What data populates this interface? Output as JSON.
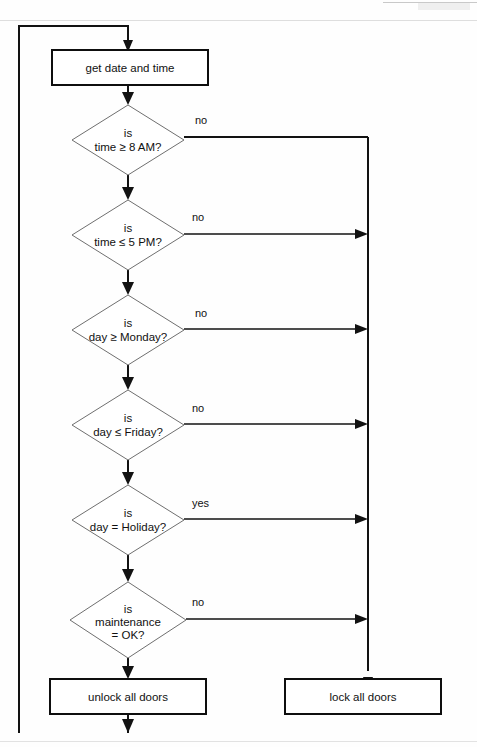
{
  "diagram": {
    "type": "flowchart",
    "canvas": {
      "width": 477,
      "height": 747
    },
    "colors": {
      "background": "#fefefe",
      "process_stroke": "#0e0e0e",
      "decision_stroke": "#6f6f6f",
      "connector": "#121212",
      "text": "#111111",
      "scan_rule": "#dedede"
    },
    "start_label": "",
    "nodes": [
      {
        "id": "get-date-time",
        "shape": "process",
        "label": "get date and time",
        "lines": [
          "get date and time"
        ],
        "x": 52,
        "y": 50,
        "w": 156,
        "h": 35
      },
      {
        "id": "time-ge-8am",
        "shape": "decision",
        "label": "is time ≥ 8 AM?",
        "lines": [
          "is",
          "time ≥ 8 "
        ],
        "tail": "AM?",
        "cx": 128,
        "cy": 140,
        "rx": 56,
        "ry": 35,
        "branch_label": "no",
        "branch_side": "right"
      },
      {
        "id": "time-le-5pm",
        "shape": "decision",
        "label": "is time ≤ 5 PM?",
        "lines": [
          "is",
          "time ≤ 5 "
        ],
        "tail": "PM?",
        "cx": 128,
        "cy": 235,
        "rx": 56,
        "ry": 35,
        "branch_label": "no",
        "branch_side": "right"
      },
      {
        "id": "day-ge-monday",
        "shape": "decision",
        "label": "is day ≥ Monday?",
        "lines": [
          "is",
          "day ≥ Monday?"
        ],
        "tail": "",
        "cx": 128,
        "cy": 330,
        "rx": 56,
        "ry": 35,
        "branch_label": "no",
        "branch_side": "right"
      },
      {
        "id": "day-le-friday",
        "shape": "decision",
        "label": "is day ≤ Friday?",
        "lines": [
          "is",
          "day ≤ Friday?"
        ],
        "tail": "",
        "cx": 128,
        "cy": 425,
        "rx": 56,
        "ry": 35,
        "branch_label": "no",
        "branch_side": "right"
      },
      {
        "id": "day-eq-holiday",
        "shape": "decision",
        "label": "is day = Holiday?",
        "lines": [
          "is",
          "day = Holiday?"
        ],
        "tail": "",
        "cx": 128,
        "cy": 520,
        "rx": 56,
        "ry": 35,
        "branch_label": "yes",
        "branch_side": "right"
      },
      {
        "id": "maintenance-ok",
        "shape": "decision",
        "label": "is maintenance = OK?",
        "lines": [
          "is",
          "maintenance",
          "= OK?"
        ],
        "tail": "",
        "cx": 128,
        "cy": 620,
        "rx": 58,
        "ry": 38,
        "branch_label": "no",
        "branch_side": "right"
      },
      {
        "id": "unlock-all-doors",
        "shape": "process",
        "label": "unlock all doors",
        "lines": [
          "unlock all doors"
        ],
        "x": 50,
        "y": 679,
        "w": 156,
        "h": 35
      },
      {
        "id": "lock-all-doors",
        "shape": "process",
        "label": "lock all doors",
        "lines": [
          "lock all doors"
        ],
        "x": 285,
        "y": 679,
        "w": 156,
        "h": 35
      }
    ],
    "branch_labels": [
      {
        "for": "time-ge-8am",
        "text": "no",
        "x": 195,
        "y": 124
      },
      {
        "for": "time-le-5pm",
        "text": "no",
        "x": 192,
        "y": 221
      },
      {
        "for": "day-ge-monday",
        "text": "no",
        "x": 195,
        "y": 317
      },
      {
        "for": "day-le-friday",
        "text": "no",
        "x": 192,
        "y": 412
      },
      {
        "for": "day-eq-holiday",
        "text": "yes",
        "x": 192,
        "y": 507
      },
      {
        "for": "maintenance-ok",
        "text": "no",
        "x": 192,
        "y": 606
      }
    ],
    "loop": {
      "description": "return from unlock all doors back to get date and time",
      "left_x": 19,
      "top_y": 26,
      "bottom_y": 733,
      "entry_x": 128
    },
    "right_rail": {
      "description": "all failing branches merge into lock all doors",
      "x": 368,
      "top_y": 137,
      "bottom_y": 677
    }
  }
}
